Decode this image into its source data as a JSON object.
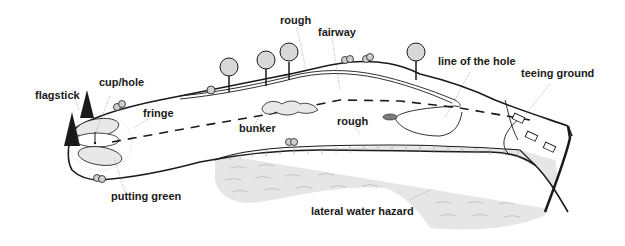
{
  "diagram": {
    "labels": {
      "rough_top": "rough",
      "fairway": "fairway",
      "line_of_the_hole": "line of the hole",
      "teeing_ground": "teeing ground",
      "flagstick": "flagstick",
      "cup_hole": "cup/hole",
      "fringe": "fringe",
      "bunker": "bunker",
      "rough_bottom": "rough",
      "putting_green": "putting green",
      "lateral_water_hazard": "lateral water hazard"
    },
    "colors": {
      "ink": "#1a1a1a",
      "water": "#e6e6e6",
      "green_fill": "#e8e8e8",
      "paper": "#ffffff"
    }
  }
}
